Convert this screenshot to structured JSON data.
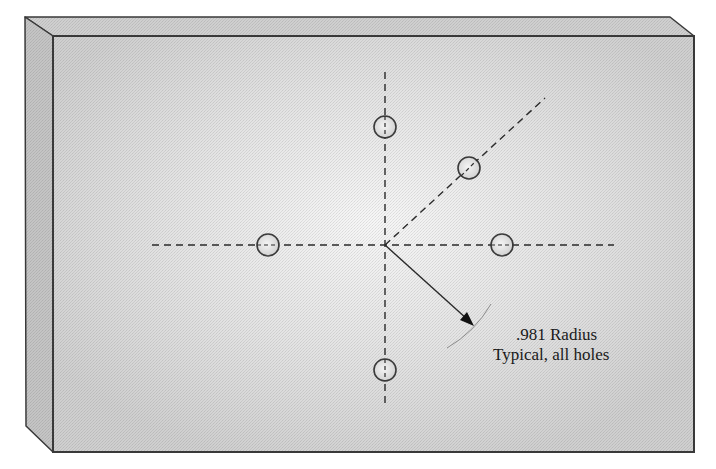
{
  "diagram": {
    "annotation": {
      "line1": ".981 Radius",
      "line2": "Typical, all holes"
    },
    "colors": {
      "front_face": "#d6d6d6",
      "front_face_center": "#f4f4f4",
      "top_face": "#cfcfcf",
      "left_face": "#c2c2c2",
      "edge": "#3a3a3a",
      "centerline": "#2a2a2a",
      "hole_fill": "#ececec",
      "hole_stroke": "#3a3a3a",
      "arc": "#8a8a8a"
    },
    "block": {
      "front_face": {
        "x1": 53,
        "y1": 36,
        "x2": 694,
        "y2": 452
      },
      "back_top_left": {
        "x": 25,
        "y": 17
      },
      "back_top_right": {
        "x": 670,
        "y": 17
      },
      "back_bottom_left": {
        "x": 26,
        "y": 426
      }
    },
    "center": {
      "x": 385,
      "y": 245
    },
    "centerlines": [
      {
        "id": "horizontal",
        "x1": 152,
        "y1": 245,
        "x2": 614,
        "y2": 245
      },
      {
        "id": "vertical",
        "x1": 385,
        "y1": 72,
        "x2": 385,
        "y2": 405
      },
      {
        "id": "diagonal-45",
        "x1": 385,
        "y1": 245,
        "x2": 545,
        "y2": 98
      }
    ],
    "holes": [
      {
        "id": "top",
        "cx": 385,
        "cy": 127,
        "r": 11
      },
      {
        "id": "diagonal",
        "cx": 469,
        "cy": 168,
        "r": 11
      },
      {
        "id": "left",
        "cx": 268,
        "cy": 245,
        "r": 11
      },
      {
        "id": "right",
        "cx": 502,
        "cy": 245,
        "r": 11
      },
      {
        "id": "bottom",
        "cx": 385,
        "cy": 370,
        "r": 11
      }
    ],
    "radius_arrow": {
      "x1": 385,
      "y1": 245,
      "x2": 473,
      "y2": 325
    },
    "radius_arc": {
      "r": 120,
      "start_deg": 28,
      "end_deg": 58
    }
  }
}
